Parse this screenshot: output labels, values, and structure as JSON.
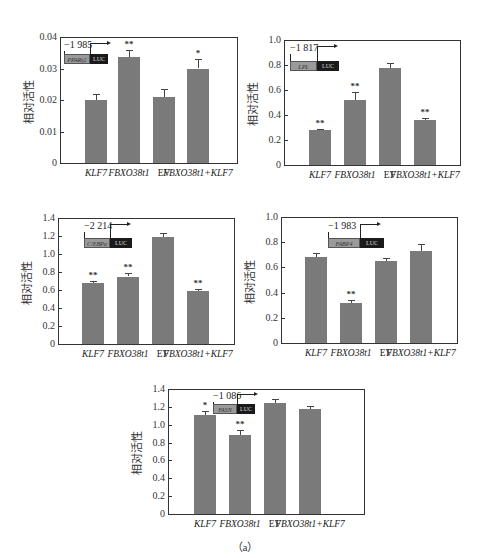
{
  "figure": {
    "caption": "（a）"
  },
  "chart_data": [
    {
      "type": "bar",
      "title": "",
      "promoter": {
        "position": "−1 985",
        "gene": "PPARγ2",
        "reporter": "LUC"
      },
      "categories": [
        "KLF7",
        "FBXO38t1",
        "EV",
        "FBXO38t1+KLF7"
      ],
      "values": [
        0.02,
        0.0335,
        0.021,
        0.03
      ],
      "errors": [
        0.0018,
        0.0025,
        0.0025,
        0.003
      ],
      "significance": [
        "",
        "**",
        "",
        "*"
      ],
      "xlabel": "",
      "ylabel": "相对活性",
      "ylim": [
        0,
        0.04
      ],
      "yticks": [
        "0",
        "0.01",
        "0.02",
        "0.03",
        "0.04"
      ],
      "grid": false
    },
    {
      "type": "bar",
      "title": "",
      "promoter": {
        "position": "−1 817",
        "gene": "LPL",
        "reporter": "LUC"
      },
      "categories": [
        "KLF7",
        "FBXO38t1",
        "EV",
        "FBXO38t1+KLF7"
      ],
      "values": [
        0.28,
        0.52,
        0.78,
        0.36
      ],
      "errors": [
        0.005,
        0.065,
        0.035,
        0.02
      ],
      "significance": [
        "**",
        "**",
        "",
        "**"
      ],
      "xlabel": "",
      "ylabel": "相对活性",
      "ylim": [
        0,
        1.0
      ],
      "yticks": [
        "0",
        "0.2",
        "0.4",
        "0.6",
        "0.8",
        "1.0"
      ],
      "grid": false
    },
    {
      "type": "bar",
      "title": "",
      "promoter": {
        "position": "−2 214",
        "gene": "C/EBPα",
        "reporter": "LUC"
      },
      "categories": [
        "KLF7",
        "FBXO38t1",
        "EV",
        "FBXO38t1+KLF7"
      ],
      "values": [
        0.68,
        0.75,
        1.19,
        0.59
      ],
      "errors": [
        0.02,
        0.04,
        0.04,
        0.025
      ],
      "significance": [
        "**",
        "**",
        "",
        "**"
      ],
      "xlabel": "",
      "ylabel": "相对活性",
      "ylim": [
        0,
        1.4
      ],
      "yticks": [
        "0",
        "0.2",
        "0.4",
        "0.6",
        "0.8",
        "1.0",
        "1.2",
        "1.4"
      ],
      "grid": false
    },
    {
      "type": "bar",
      "title": "",
      "promoter": {
        "position": "−1 983",
        "gene": "FABP4",
        "reporter": "LUC"
      },
      "categories": [
        "KLF7",
        "FBXO38t1",
        "EV",
        "FBXO38t1+KLF7"
      ],
      "values": [
        0.68,
        0.32,
        0.65,
        0.73
      ],
      "errors": [
        0.035,
        0.02,
        0.025,
        0.055
      ],
      "significance": [
        "",
        "**",
        "",
        ""
      ],
      "xlabel": "",
      "ylabel": "相对活性",
      "ylim": [
        0,
        1.0
      ],
      "yticks": [
        "0",
        "0.2",
        "0.4",
        "0.6",
        "0.8",
        "1.0"
      ],
      "grid": false
    },
    {
      "type": "bar",
      "title": "",
      "promoter": {
        "position": "−1 086",
        "gene": "FASN",
        "reporter": "LUC"
      },
      "categories": [
        "KLF7",
        "FBXO38t1",
        "EV",
        "FBXO38t1+KLF7"
      ],
      "values": [
        1.11,
        0.89,
        1.24,
        1.18
      ],
      "errors": [
        0.04,
        0.05,
        0.05,
        0.03
      ],
      "significance": [
        "*",
        "**",
        "",
        ""
      ],
      "xlabel": "",
      "ylabel": "相对活性",
      "ylim": [
        0,
        1.4
      ],
      "yticks": [
        "0",
        "0.2",
        "0.4",
        "0.6",
        "0.8",
        "1.0",
        "1.2",
        "1.4"
      ],
      "grid": false
    }
  ]
}
